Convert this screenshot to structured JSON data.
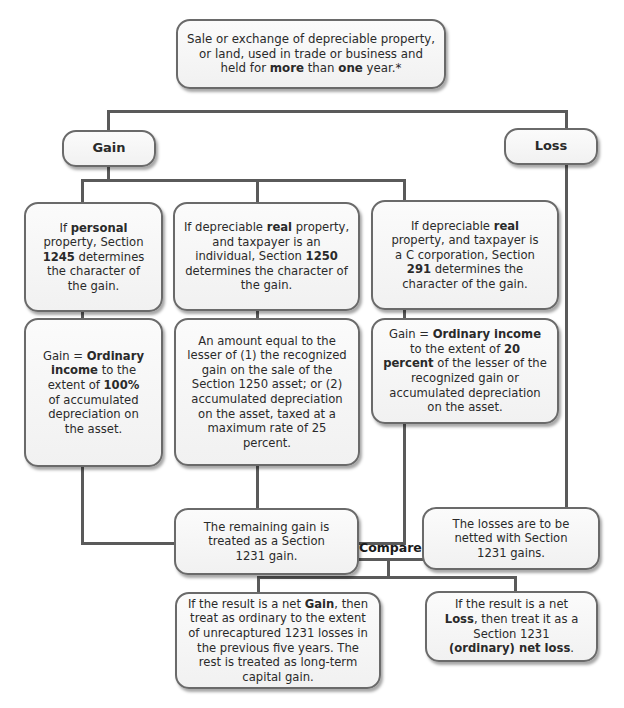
{
  "top": {
    "segments": [
      {
        "t": "Sale or exchange of depreciable property, or land, used in trade or business and held for "
      },
      {
        "t": "more",
        "b": true
      },
      {
        "t": " than "
      },
      {
        "t": "one",
        "b": true
      },
      {
        "t": " year.*"
      }
    ]
  },
  "gain_label": "Gain",
  "loss_label": "Loss",
  "col1_rule": {
    "segments": [
      {
        "t": "If "
      },
      {
        "t": "personal",
        "b": true
      },
      {
        "t": " property, Section "
      },
      {
        "t": "1245",
        "b": true
      },
      {
        "t": " determines the character of the gain."
      }
    ]
  },
  "col2_rule": {
    "segments": [
      {
        "t": "If depreciable "
      },
      {
        "t": "real",
        "b": true
      },
      {
        "t": " property, and taxpayer is an individual, Section "
      },
      {
        "t": "1250",
        "b": true
      },
      {
        "t": " determines the character of the gain."
      }
    ]
  },
  "col3_rule": {
    "segments": [
      {
        "t": "If depreciable "
      },
      {
        "t": "real",
        "b": true
      },
      {
        "t": " property, and taxpayer is a C corporation, Section "
      },
      {
        "t": "291",
        "b": true
      },
      {
        "t": " determines the character of the gain."
      }
    ]
  },
  "col1_result": {
    "segments": [
      {
        "t": "Gain = "
      },
      {
        "t": "Ordinary income",
        "b": true
      },
      {
        "t": " to the extent of "
      },
      {
        "t": "100%",
        "b": true
      },
      {
        "t": " of accumulated depreciation on the asset."
      }
    ]
  },
  "col2_result": {
    "segments": [
      {
        "t": "An amount equal to the lesser of (1) the recognized gain on the sale of the Section 1250 asset; or (2) accumulated depreciation on the asset, taxed at a maximum rate of 25 percent."
      }
    ]
  },
  "col3_result": {
    "segments": [
      {
        "t": "Gain = "
      },
      {
        "t": "Ordinary income",
        "b": true
      },
      {
        "t": " to the extent of "
      },
      {
        "t": "20 percent",
        "b": true
      },
      {
        "t": " of the lesser of the recognized gain or accumulated depreciation on the asset."
      }
    ]
  },
  "remaining_gain": {
    "segments": [
      {
        "t": "The remaining gain is treated as a Section 1231 gain."
      }
    ]
  },
  "losses_netted": {
    "segments": [
      {
        "t": "The losses are to be netted with Section 1231 gains."
      }
    ]
  },
  "compare_label": "Compare",
  "net_gain": {
    "segments": [
      {
        "t": "If the result is a net "
      },
      {
        "t": "Gain",
        "b": true
      },
      {
        "t": ", then treat as ordinary to the extent of unrecaptured 1231 losses in the previous five years. The rest is treated as long-term capital gain."
      }
    ]
  },
  "net_loss": {
    "segments": [
      {
        "t": "If the result is a net "
      },
      {
        "t": "Loss",
        "b": true
      },
      {
        "t": ", then treat it as a Section 1231 "
      },
      {
        "t": "(ordinary) net loss",
        "b": true
      },
      {
        "t": "."
      }
    ]
  },
  "colors": {
    "line": "#5a5a5a",
    "box_border": "#6a6a6a",
    "box_fill": "#f5f5f5"
  }
}
